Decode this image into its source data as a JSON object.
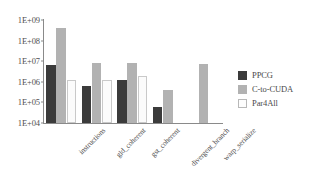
{
  "chart_data": {
    "type": "bar",
    "title": "",
    "xlabel": "",
    "ylabel": "",
    "yscale": "log",
    "ylim": [
      10000,
      1000000000
    ],
    "ytick_labels": [
      "1E+09",
      "1E+08",
      "1E+07",
      "1E+06",
      "1E+05",
      "1E+04"
    ],
    "ytick_values": [
      1000000000,
      100000000,
      10000000,
      1000000,
      100000,
      10000
    ],
    "grid": false,
    "legend_position": "right",
    "categories": [
      "instructions",
      "gld_coherent",
      "gst_coherent",
      "divergent_branch",
      "warp_serialize"
    ],
    "series": [
      {
        "name": "PPCG",
        "color": "#3b3b3b",
        "values": [
          6800000,
          600000,
          1200000,
          62000,
          null
        ]
      },
      {
        "name": "C-to-CUDA",
        "color": "#b2b2b2",
        "values": [
          420000000,
          8000000,
          8000000,
          420000,
          7000000
        ]
      },
      {
        "name": "Par4All",
        "color": "#fbfbfb",
        "values": [
          1250000,
          1250000,
          2000000,
          null,
          null
        ]
      }
    ]
  },
  "legend": {
    "items": [
      {
        "label": "PPCG",
        "swatch": "series-0-swatch"
      },
      {
        "label": "C-to-CUDA",
        "swatch": "series-1-swatch"
      },
      {
        "label": "Par4All",
        "swatch": "series-2-swatch"
      }
    ]
  }
}
